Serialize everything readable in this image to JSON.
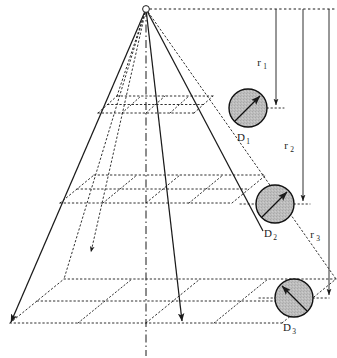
{
  "figure": {
    "type": "technical-diagram",
    "background_color": "#ffffff",
    "line_color": "#1a1a1a",
    "disk_fill_color": "#b8b8b8",
    "disk_stroke_color": "#111111"
  },
  "source": {
    "name": "point-source",
    "x": 146,
    "y": 9,
    "radius": 3.2
  },
  "axis": {
    "name": "optical-axis",
    "style": "dash-dot",
    "x": 146,
    "y_top": 9,
    "y_bottom": 356
  },
  "rays": [
    {
      "name": "ray-left",
      "x1": 146,
      "y1": 9,
      "x2": 11,
      "y2": 323
    },
    {
      "name": "ray-center-right",
      "x1": 146,
      "y1": 9,
      "x2": 182,
      "y2": 322
    },
    {
      "name": "ray-right",
      "x1": 146,
      "y1": 9,
      "x2": 261,
      "y2": 229
    }
  ],
  "planes": [
    {
      "name": "grid-plane-1",
      "label": "near plane",
      "cx": 146,
      "cy": 113,
      "half_width": 48,
      "depth_x": 19,
      "depth_y": -17,
      "divisions": 2
    },
    {
      "name": "grid-plane-2",
      "label": "middle plane",
      "cx": 146,
      "cy": 203,
      "half_width": 86,
      "depth_x": 34,
      "depth_y": -28,
      "divisions": 2
    },
    {
      "name": "grid-plane-3",
      "label": "far plane",
      "cx": 146,
      "cy": 323,
      "half_width": 136,
      "depth_x": 54,
      "depth_y": -44,
      "divisions": 2
    }
  ],
  "top_reference_line": {
    "name": "top-dotted-reference-line",
    "x1": 150,
    "x2": 337,
    "y": 9,
    "style": "dotted"
  },
  "detectors": [
    {
      "id": "D1",
      "label": "D",
      "subscript": "1",
      "cx": 248,
      "cy": 108,
      "r": 19,
      "arrow": {
        "from_x": 235,
        "from_y": 121,
        "to_x": 261,
        "to_y": 95,
        "direction": "up-right"
      },
      "leader_line": {
        "x1": 267,
        "x2": 282,
        "y": 108,
        "style": "dotted"
      },
      "label_x": 248,
      "label_y": 141
    },
    {
      "id": "D2",
      "label": "D",
      "subscript": "2",
      "cx": 275,
      "cy": 204,
      "r": 19,
      "arrow": {
        "from_x": 262,
        "from_y": 217,
        "to_x": 288,
        "to_y": 191,
        "direction": "up-right"
      },
      "leader_line": {
        "x1": 294,
        "x2": 307,
        "y": 204,
        "style": "dotted"
      },
      "label_x": 275,
      "label_y": 237
    },
    {
      "id": "D3",
      "label": "D",
      "subscript": "3",
      "cx": 294,
      "cy": 298,
      "r": 19,
      "arrow": {
        "from_x": 307,
        "from_y": 311,
        "to_x": 281,
        "to_y": 285,
        "direction": "up-left"
      },
      "leader_line": {
        "x1": 265,
        "x2": 281,
        "y": 298,
        "style": "dotted"
      },
      "label_x": 294,
      "label_y": 331
    }
  ],
  "distance_markers": [
    {
      "id": "r1",
      "label": "r",
      "subscript": "1",
      "x": 276,
      "y_start": 9,
      "y_end": 107,
      "label_x": 262,
      "label_y": 63
    },
    {
      "id": "r2",
      "label": "r",
      "subscript": "2",
      "x": 303,
      "y_start": 9,
      "y_end": 203,
      "label_x": 289,
      "label_y": 146
    },
    {
      "id": "r3",
      "label": "r",
      "subscript": "3",
      "x": 328,
      "y_start": 9,
      "y_end": 297,
      "label_x": 314,
      "label_y": 235
    }
  ]
}
